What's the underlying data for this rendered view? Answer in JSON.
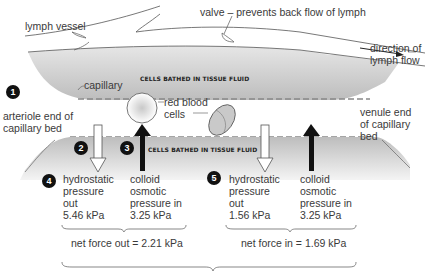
{
  "labels": {
    "lymph_vessel": "lymph vessel",
    "valve": "valve – prevents back flow of lymph",
    "direction": "direction of\nlymph flow",
    "capillary": "capillary",
    "cells_tissue_fluid_top": "CELLS BATHED IN TISSUE FLUID",
    "cells_tissue_fluid_bottom": "CELLS BATHED IN TISSUE FLUID",
    "arteriole_end": "arteriole end of\ncapillary bed",
    "venule_end": "venule end\nof capillary\nbed",
    "red_blood_cells": "red blood\ncells"
  },
  "badges": [
    "1",
    "2",
    "3",
    "4",
    "5"
  ],
  "arteriole_side": {
    "hydrostatic": "hydrostatic\npressure\nout\n5.46 kPa",
    "colloid": "colloid\nosmotic\npressure in\n3.25 kPa",
    "net": "net force out = 2.21 kPa"
  },
  "venule_side": {
    "hydrostatic": "hydrostatic\npressure\nout\n1.56 kPa",
    "colloid": "colloid\nosmotic\npressure in\n3.25 kPa",
    "net": "net force in = 1.69 kPa"
  },
  "colors": {
    "tissue_gray": "#c8c8c8",
    "badge": "#111111",
    "arrow_dark": "#111111"
  }
}
